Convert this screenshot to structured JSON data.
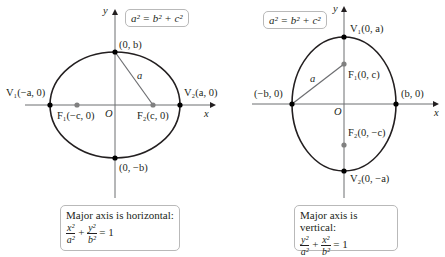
{
  "left_diagram": {
    "relation": "a² = b² + c²",
    "axis_x_label": "x",
    "axis_y_label": "y",
    "origin_label": "O",
    "top_point": "(0, b)",
    "bottom_point": "(0, −b)",
    "v1_label": "V₁(−a, 0)",
    "v2_label": "V₂(a, 0)",
    "f1_label": "F₁(−c, 0)",
    "f2_label": "F₂(c, 0)",
    "segment_label": "a",
    "caption_title": "Major axis is horizontal:",
    "eq_term1_num": "x²",
    "eq_term1_den": "a²",
    "eq_term2_num": "y²",
    "eq_term2_den": "b²",
    "eq_plus": "+",
    "eq_rhs": "= 1"
  },
  "right_diagram": {
    "relation": "a² = b² + c²",
    "axis_x_label": "x",
    "axis_y_label": "y",
    "origin_label": "O",
    "left_point": "(−b, 0)",
    "right_point": "(b, 0)",
    "v1_label": "V₁(0, a)",
    "v2_label": "V₂(0, −a)",
    "f1_label": "F₁(0, c)",
    "f2_label": "F₂(0, −c)",
    "segment_label": "a",
    "caption_title": "Major axis is vertical:",
    "eq_term1_num": "y²",
    "eq_term1_den": "a²",
    "eq_term2_num": "x²",
    "eq_term2_den": "b²",
    "eq_plus": "+",
    "eq_rhs": "= 1"
  },
  "colors": {
    "curve": "#231f20",
    "axis": "#6d6e71",
    "focus": "#808080",
    "box_border": "#b9b9b9"
  }
}
